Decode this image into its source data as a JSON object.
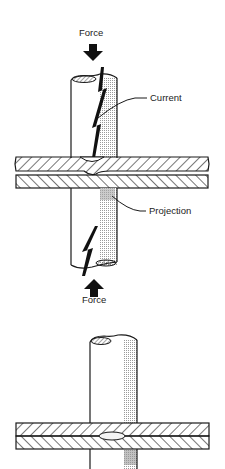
{
  "figure_top": {
    "labels": {
      "force_top": "Force",
      "current": "Current",
      "projection": "Projection",
      "force_bottom": "Force"
    }
  },
  "figure_bottom": {
    "description": "Welded projection nugget between plates"
  },
  "colors": {
    "line": "#1a1a1a",
    "shade": "#c8c8c8",
    "background": "#ffffff"
  }
}
